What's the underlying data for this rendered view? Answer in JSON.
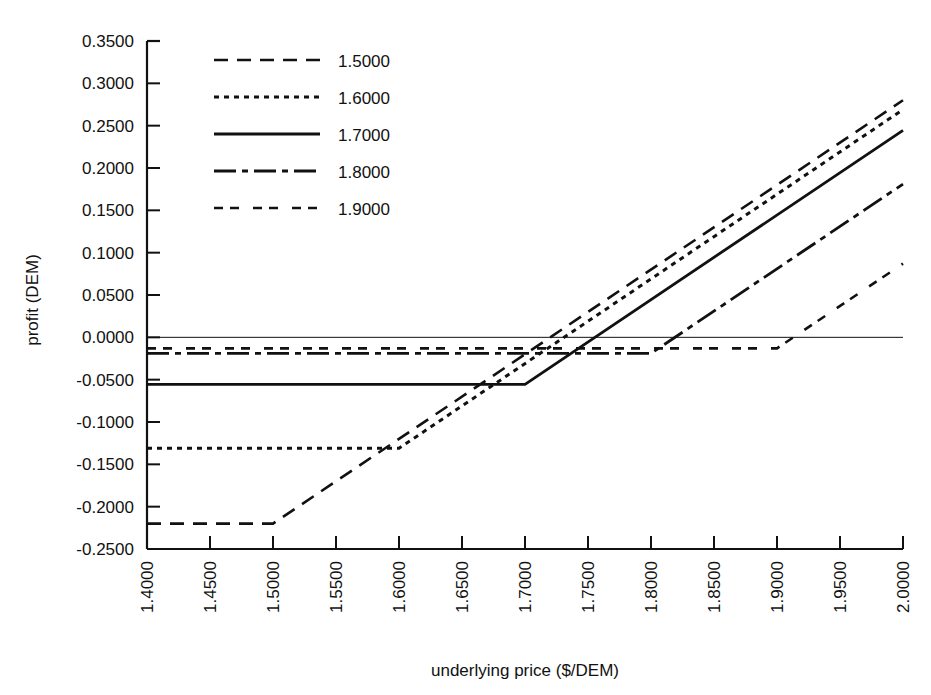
{
  "chart_data": {
    "type": "line",
    "title": "",
    "xlabel": "underlying price ($/DEM)",
    "ylabel": "profit (DEM)",
    "xlim": [
      1.4,
      2.0
    ],
    "ylim": [
      -0.25,
      0.35
    ],
    "grid": false,
    "legend_position": "top-left-inside",
    "xticks": [
      "1.4000",
      "1.4500",
      "1.5000",
      "1.5500",
      "1.6000",
      "1.6500",
      "1.7000",
      "1.7500",
      "1.8000",
      "1.8500",
      "1.9000",
      "1.9500",
      "2.0000"
    ],
    "xtick_values": [
      1.4,
      1.45,
      1.5,
      1.55,
      1.6,
      1.65,
      1.7,
      1.75,
      1.8,
      1.85,
      1.9,
      1.95,
      2.0
    ],
    "yticks": [
      "0.3500",
      "0.3000",
      "0.2500",
      "0.2000",
      "0.1500",
      "0.1000",
      "0.0500",
      "0.0000",
      "-0.0500",
      "-0.1000",
      "-0.1500",
      "-0.2000",
      "-0.2500"
    ],
    "ytick_values": [
      0.35,
      0.3,
      0.25,
      0.2,
      0.15,
      0.1,
      0.05,
      0.0,
      -0.05,
      -0.1,
      -0.15,
      -0.2,
      -0.25
    ],
    "zero_reference_line": 0.0,
    "series": [
      {
        "name": "1.5000",
        "strike": 1.5,
        "dash": "14,9",
        "width": 2.6,
        "x": [
          1.4,
          1.5,
          2.0
        ],
        "values": [
          -0.22,
          -0.22,
          0.28
        ]
      },
      {
        "name": "1.6000",
        "strike": 1.6,
        "dash": "5,5",
        "width": 3.0,
        "x": [
          1.4,
          1.6,
          2.0
        ],
        "values": [
          -0.131,
          -0.131,
          0.269
        ]
      },
      {
        "name": "1.7000",
        "strike": 1.7,
        "dash": "none",
        "width": 2.8,
        "x": [
          1.4,
          1.7,
          2.0
        ],
        "values": [
          -0.0555,
          -0.0555,
          0.2445
        ]
      },
      {
        "name": "1.8000",
        "strike": 1.8,
        "dash": "22,6,6,6",
        "width": 2.8,
        "x": [
          1.4,
          1.8,
          2.0
        ],
        "values": [
          -0.019,
          -0.019,
          0.181
        ]
      },
      {
        "name": "1.9000",
        "strike": 1.9,
        "dash": "9,7,9,14",
        "width": 2.6,
        "x": [
          1.4,
          1.9,
          2.0
        ],
        "values": [
          -0.013,
          -0.013,
          0.087
        ]
      }
    ]
  },
  "legend": {
    "entries": [
      "1.5000",
      "1.6000",
      "1.7000",
      "1.8000",
      "1.9000"
    ]
  },
  "axes": {
    "x_title": "underlying price ($/DEM)",
    "y_title": "profit (DEM)"
  }
}
